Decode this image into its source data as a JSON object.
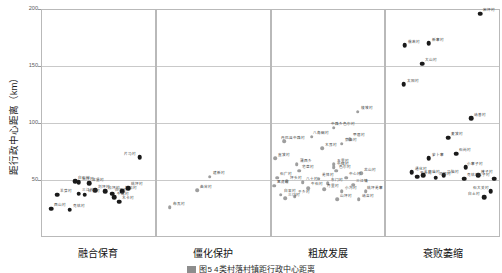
{
  "chart_data": {
    "type": "scatter",
    "title": "",
    "xlabel": "",
    "ylabel": "距行政中心距离（km）",
    "caption": "图5  4类村落村镇距行政中心距离",
    "ylim": [
      0,
      200
    ],
    "yticks": [
      200,
      150,
      100,
      50
    ],
    "ytick_labels": [
      "200",
      "150",
      "100",
      "50"
    ],
    "grid": true,
    "legend_position": "none",
    "categories": [
      "融合保育",
      "僵化保护",
      "粗放发展",
      "衰败萎缩"
    ],
    "series": [
      {
        "name": "融合保育",
        "color": "#1a1a1a",
        "points": [
          {
            "label": "片马村",
            "x": 0.86,
            "y": 70
          },
          {
            "label": "长坪村",
            "x": 0.33,
            "y": 48
          },
          {
            "label": "甘堡村",
            "x": 0.42,
            "y": 47
          },
          {
            "label": "白石村",
            "x": 0.3,
            "y": 49
          },
          {
            "label": "刘坪村",
            "x": 0.47,
            "y": 41
          },
          {
            "label": "松坪村",
            "x": 0.56,
            "y": 40
          },
          {
            "label": "日别村",
            "x": 0.38,
            "y": 37
          },
          {
            "label": "三江村",
            "x": 0.33,
            "y": 38
          },
          {
            "label": "白河村",
            "x": 0.62,
            "y": 38
          },
          {
            "label": "独松村",
            "x": 0.71,
            "y": 40
          },
          {
            "label": "桃坪村",
            "x": 0.76,
            "y": 43
          },
          {
            "label": "牛尾村",
            "x": 0.64,
            "y": 35
          },
          {
            "label": "羊茸村",
            "x": 0.14,
            "y": 37
          },
          {
            "label": "木卡村",
            "x": 0.68,
            "y": 31
          },
          {
            "label": "西山村",
            "x": 0.09,
            "y": 25
          },
          {
            "label": "克枯村",
            "x": 0.25,
            "y": 24
          }
        ]
      },
      {
        "name": "僵化保护",
        "color": "#9e9e9e",
        "points": [
          {
            "label": "建新村",
            "x": 0.47,
            "y": 53
          },
          {
            "label": "曲谷村",
            "x": 0.36,
            "y": 41
          },
          {
            "label": "布瓦村",
            "x": 0.12,
            "y": 26
          }
        ]
      },
      {
        "name": "粗放发展",
        "color": "#9e9e9e",
        "points": [
          {
            "label": "梭坡村",
            "x": 0.76,
            "y": 110
          },
          {
            "label": "中路乡色尔村",
            "x": 0.55,
            "y": 96
          },
          {
            "label": "八角碉村",
            "x": 0.36,
            "y": 88
          },
          {
            "label": "甲居村",
            "x": 0.69,
            "y": 86
          },
          {
            "label": "丹巴县中路村",
            "x": 0.12,
            "y": 84
          },
          {
            "label": "莫洛村",
            "x": 0.62,
            "y": 82
          },
          {
            "label": "木耳村",
            "x": 0.45,
            "y": 78
          },
          {
            "label": "直波村",
            "x": 0.04,
            "y": 69
          },
          {
            "label": "蒲西乡",
            "x": 0.23,
            "y": 64
          },
          {
            "label": "五里村",
            "x": 0.55,
            "y": 64
          },
          {
            "label": "中纽村",
            "x": 0.55,
            "y": 61
          },
          {
            "label": "宅垄村",
            "x": 0.25,
            "y": 58
          },
          {
            "label": "色尔村",
            "x": 0.57,
            "y": 58
          },
          {
            "label": "龙山村",
            "x": 0.79,
            "y": 56
          },
          {
            "label": "石广村",
            "x": 0.06,
            "y": 52
          },
          {
            "label": "羌锋村",
            "x": 0.42,
            "y": 51
          },
          {
            "label": "中心村",
            "x": 0.66,
            "y": 52
          },
          {
            "label": "坪头村",
            "x": 0.14,
            "y": 49
          },
          {
            "label": "八十村",
            "x": 0.28,
            "y": 48
          },
          {
            "label": "东门村",
            "x": 0.5,
            "y": 47
          },
          {
            "label": "三江镇",
            "x": 0.72,
            "y": 46
          },
          {
            "label": "黑虎村",
            "x": 0.03,
            "y": 45
          },
          {
            "label": "牛石村",
            "x": 0.33,
            "y": 43
          },
          {
            "label": "月里村",
            "x": 0.47,
            "y": 42
          },
          {
            "label": "小沟村",
            "x": 0.62,
            "y": 40
          },
          {
            "label": "桃坪羌寨",
            "x": 0.83,
            "y": 40
          },
          {
            "label": "白果村",
            "x": 0.09,
            "y": 37
          },
          {
            "label": "于乡村",
            "x": 0.21,
            "y": 36
          },
          {
            "label": "三门村",
            "x": 0.13,
            "y": 34
          },
          {
            "label": "山坪村",
            "x": 0.58,
            "y": 33
          },
          {
            "label": "纳吉村",
            "x": 0.77,
            "y": 33
          }
        ]
      },
      {
        "name": "衰败萎缩",
        "color": "#1a1a1a",
        "points": [
          {
            "label": "宋坪村",
            "x": 0.83,
            "y": 196
          },
          {
            "label": "新寨村",
            "x": 0.38,
            "y": 170
          },
          {
            "label": "俄若村",
            "x": 0.17,
            "y": 168
          },
          {
            "label": "大山村",
            "x": 0.32,
            "y": 152
          },
          {
            "label": "太阳村",
            "x": 0.16,
            "y": 134
          },
          {
            "label": "纳普村",
            "x": 0.75,
            "y": 104
          },
          {
            "label": "麦波村",
            "x": 0.55,
            "y": 87
          },
          {
            "label": "石岗村",
            "x": 0.62,
            "y": 73
          },
          {
            "label": "萝卜寨",
            "x": 0.38,
            "y": 69
          },
          {
            "label": "小寨子村",
            "x": 0.7,
            "y": 61
          },
          {
            "label": "通化村",
            "x": 0.23,
            "y": 57
          },
          {
            "label": "三官庙村",
            "x": 0.33,
            "y": 54
          },
          {
            "label": "马脑村",
            "x": 0.51,
            "y": 54
          },
          {
            "label": "楼子村",
            "x": 0.81,
            "y": 54
          },
          {
            "label": "平头村",
            "x": 0.28,
            "y": 53
          },
          {
            "label": "河坝村",
            "x": 0.44,
            "y": 52
          },
          {
            "label": "克枯村",
            "x": 0.69,
            "y": 51
          },
          {
            "label": "店子村",
            "x": 0.95,
            "y": 51
          },
          {
            "label": "石大关村",
            "x": 0.92,
            "y": 40
          },
          {
            "label": "白土村",
            "x": 0.86,
            "y": 35
          }
        ]
      }
    ]
  }
}
